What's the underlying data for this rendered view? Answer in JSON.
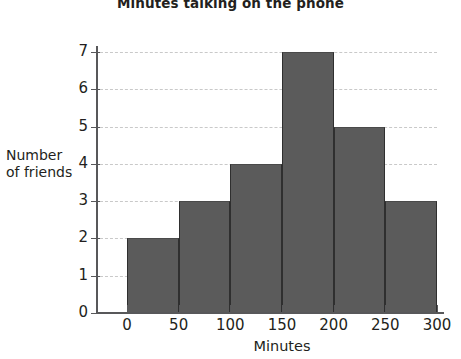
{
  "chart_data": {
    "type": "bar",
    "chart_subtype": "histogram",
    "title": "Minutes talking on the phone",
    "xlabel": "Minutes",
    "ylabel": "Number of friends",
    "ylabel_lines": [
      "Number",
      "of friends"
    ],
    "categories": [
      "0-50",
      "50-100",
      "100-150",
      "150-200",
      "200-250",
      "250-300"
    ],
    "bin_edges": [
      0,
      50,
      100,
      150,
      200,
      250,
      300
    ],
    "values": [
      2,
      3,
      4,
      7,
      5,
      3
    ],
    "xlim": [
      0,
      300
    ],
    "ylim": [
      0,
      7
    ],
    "x_ticks": [
      0,
      50,
      100,
      150,
      200,
      250,
      300
    ],
    "y_ticks": [
      0,
      1,
      2,
      3,
      4,
      5,
      6,
      7
    ],
    "x_tick_labels": [
      "0",
      "50",
      "100",
      "150",
      "200",
      "250",
      "300"
    ],
    "y_tick_labels": [
      "0",
      "1",
      "2",
      "3",
      "4",
      "5",
      "6",
      "7"
    ],
    "grid": true,
    "grid_orientation": "horizontal",
    "grid_style": "dashed",
    "legend": false,
    "bar_color": "#5b5b5b",
    "bar_edge_color": "#2f2f2f",
    "grid_color": "#c9c9c9",
    "axis_color": "#58585a",
    "background_color": "#ffffff",
    "text_color": "#231f20"
  }
}
